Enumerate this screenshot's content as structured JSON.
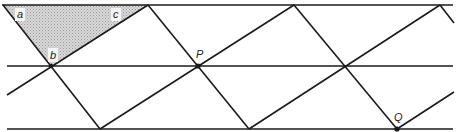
{
  "figure": {
    "colors": {
      "line": "#1a1a1a",
      "shade": "#c8c8c8",
      "background": "#ffffff"
    },
    "horizontal_lines": [
      {
        "name": "top-line",
        "y": 5,
        "x1": 2,
        "x2": 453
      },
      {
        "name": "middle-line",
        "y": 66,
        "x1": 7,
        "x2": 453
      },
      {
        "name": "bottom-line",
        "y": 129,
        "x1": 7,
        "x2": 453
      }
    ],
    "labels": {
      "a": "a",
      "b": "b",
      "c": "c",
      "P": "P",
      "Q": "Q"
    },
    "points": {
      "P": {
        "x": 198,
        "y": 66
      },
      "Q": {
        "x": 397,
        "y": 129
      }
    }
  }
}
